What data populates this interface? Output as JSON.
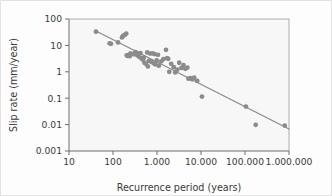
{
  "figure": {
    "background_color": "#fdfdfd",
    "border_color": "#e3e3e3",
    "plot_background_color": "#f7f7f7",
    "axis_color": "#6e6e6e",
    "point_color": "#8b8b8b",
    "line_color": "#8b8b8b",
    "text_color": "#3a3a3a"
  },
  "chart_data": {
    "type": "scatter",
    "title": "",
    "subtitle": "",
    "xlabel": "Recurrence period (years)",
    "ylabel": "Slip rate (mm/year)",
    "xscale": "log",
    "yscale": "log",
    "xlim": [
      10,
      1000000
    ],
    "ylim": [
      0.001,
      100
    ],
    "grid": false,
    "legend": null,
    "xticks": [
      10,
      100,
      1000,
      10000,
      100000,
      1000000
    ],
    "xtick_labels": [
      "10",
      "100",
      "1.000",
      "10.000",
      "100.000",
      "1.000.000"
    ],
    "yticks": [
      0.001,
      0.01,
      0.1,
      1,
      10,
      100
    ],
    "ytick_labels": [
      "0.001",
      "0.01",
      "0.1",
      "1",
      "10",
      "100"
    ],
    "annotations": [],
    "series": [
      {
        "name": "Fault slip-rate vs recurrence interval",
        "type": "scatter",
        "marker": "circle",
        "marker_size": 2.4,
        "color": "#8b8b8b",
        "points": [
          [
            41,
            33
          ],
          [
            84,
            12
          ],
          [
            90,
            11.5
          ],
          [
            130,
            13
          ],
          [
            160,
            20
          ],
          [
            170,
            23
          ],
          [
            185,
            25
          ],
          [
            200,
            28
          ],
          [
            205,
            4.2
          ],
          [
            215,
            4.0
          ],
          [
            225,
            4.3
          ],
          [
            240,
            3.9
          ],
          [
            250,
            5.0
          ],
          [
            300,
            4.6
          ],
          [
            320,
            5.5
          ],
          [
            345,
            5.2
          ],
          [
            360,
            4.1
          ],
          [
            380,
            4.8
          ],
          [
            400,
            3.6
          ],
          [
            420,
            5.1
          ],
          [
            450,
            3.2
          ],
          [
            470,
            2.9
          ],
          [
            500,
            3.4
          ],
          [
            520,
            2.2
          ],
          [
            560,
            2.0
          ],
          [
            600,
            5.4
          ],
          [
            620,
            1.6
          ],
          [
            650,
            2.6
          ],
          [
            700,
            4.9
          ],
          [
            740,
            2.4
          ],
          [
            800,
            5.0
          ],
          [
            840,
            2.1
          ],
          [
            880,
            4.7
          ],
          [
            920,
            1.9
          ],
          [
            980,
            2.7
          ],
          [
            1050,
            4.4
          ],
          [
            1100,
            1.7
          ],
          [
            1250,
            2.5
          ],
          [
            1400,
            3.0
          ],
          [
            1600,
            6.8
          ],
          [
            1700,
            3.3
          ],
          [
            1800,
            3.1
          ],
          [
            1900,
            1.0
          ],
          [
            2100,
            2.0
          ],
          [
            2400,
            1.5
          ],
          [
            2600,
            0.95
          ],
          [
            2900,
            1.2
          ],
          [
            3200,
            2.2
          ],
          [
            3600,
            1.4
          ],
          [
            4000,
            1.8
          ],
          [
            4400,
            1.3
          ],
          [
            4900,
            1.45
          ],
          [
            5200,
            0.55
          ],
          [
            5800,
            0.58
          ],
          [
            6300,
            0.52
          ],
          [
            7000,
            0.6
          ],
          [
            8200,
            0.45
          ],
          [
            10500,
            0.115
          ],
          [
            105000,
            0.048
          ],
          [
            175000,
            0.0098
          ],
          [
            800000,
            0.0092
          ]
        ]
      }
    ],
    "fit_line": {
      "name": "power-law regression",
      "color": "#8b8b8b",
      "width": 1.3,
      "x_start": 40,
      "y_start": 36,
      "x_end": 1000000,
      "y_end": 0.0068
    }
  }
}
